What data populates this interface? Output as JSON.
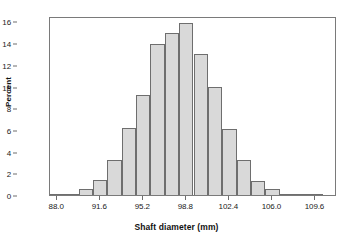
{
  "chart_data": {
    "type": "bar",
    "title": "",
    "subtitle": "",
    "xlabel": "Shaft diameter (mm)",
    "ylabel": "Percent",
    "xlim": [
      87.4,
      111.4
    ],
    "ylim": [
      0,
      16.5
    ],
    "bin_width": 1.2,
    "grid": false,
    "legend": null,
    "x_tick_labels": [
      "88.0",
      "91.6",
      "95.2",
      "98.8",
      "102.4",
      "106.0",
      "109.6"
    ],
    "x_tick_values": [
      88.0,
      91.6,
      95.2,
      98.8,
      102.4,
      106.0,
      109.6
    ],
    "y_tick_labels": [
      "0",
      "2",
      "4",
      "6",
      "8",
      "10",
      "12",
      "14",
      "16"
    ],
    "y_tick_values": [
      0,
      2,
      4,
      6,
      8,
      10,
      12,
      14,
      16
    ],
    "bin_centers": [
      88.0,
      89.2,
      90.4,
      91.6,
      92.8,
      94.0,
      95.2,
      96.4,
      97.6,
      98.8,
      100.0,
      101.2,
      102.4,
      103.6,
      104.8,
      106.0,
      107.2,
      108.4,
      109.6
    ],
    "categories": [
      "88.0",
      "89.2",
      "90.4",
      "91.6",
      "92.8",
      "94.0",
      "95.2",
      "96.4",
      "97.6",
      "98.8",
      "100.0",
      "101.2",
      "102.4",
      "103.6",
      "104.8",
      "106.0",
      "107.2",
      "108.4",
      "109.6"
    ],
    "values": [
      0.05,
      0.1,
      0.6,
      1.4,
      3.2,
      6.15,
      9.2,
      13.9,
      14.95,
      15.85,
      13.0,
      10.0,
      6.05,
      3.2,
      1.3,
      0.55,
      0.1,
      0.05,
      0.0
    ],
    "bar_fill_color": "#d9d9d9",
    "bar_border_color": "#6e6e6e",
    "frame_color": "#7a7a7a",
    "text_color": "#1a1a1a"
  }
}
